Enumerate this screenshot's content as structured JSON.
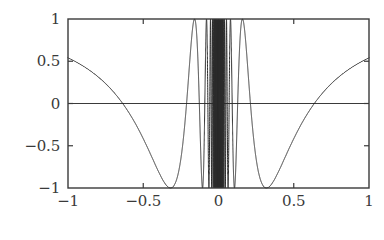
{
  "figure": {
    "background_color": "#ffffff",
    "axes_color": "#3a3a3a",
    "curve_color": "#2b2b2b",
    "zero_line_color": "#3a3a3a"
  },
  "chart_data": {
    "type": "line",
    "title": "",
    "subtitle": "",
    "xlabel": "",
    "ylabel": "",
    "function": "cos(1/x)",
    "xlim": [
      -1,
      1
    ],
    "ylim": [
      -1,
      1
    ],
    "grid": false,
    "legend": null,
    "legend_position": "none",
    "box_frame": true,
    "tick_direction": "in",
    "zero_line": true,
    "xticks": [
      -1,
      -0.5,
      0,
      0.5,
      1
    ],
    "xticklabels": [
      "-1",
      "-0.5",
      "0",
      "0.5",
      "1"
    ],
    "yticks": [
      -1,
      -0.5,
      0,
      0.5,
      1
    ],
    "yticklabels": [
      "-1",
      "-0.5",
      "0",
      "0.5",
      "1"
    ],
    "annotations": [],
    "series": [
      {
        "name": "cos(1/x)",
        "color": "#2b2b2b",
        "linewidth": 1,
        "samples": 20000,
        "x_range": [
          -1,
          1
        ],
        "key_points": [
          {
            "x": -1.0,
            "y": 0.5403
          },
          {
            "x": -0.6366,
            "y": 0.0
          },
          {
            "x": -0.5,
            "y": -0.4161
          },
          {
            "x": -0.3183,
            "y": -1.0
          },
          {
            "x": -0.2122,
            "y": 0.0
          },
          {
            "x": -0.1592,
            "y": 1.0
          },
          {
            "x": -0.1274,
            "y": 0.0
          },
          {
            "x": -0.1061,
            "y": -1.0
          },
          {
            "x": -0.05,
            "y": -0.4081
          },
          {
            "x": 0.0,
            "y": null
          },
          {
            "x": 0.05,
            "y": -0.4081
          },
          {
            "x": 0.1061,
            "y": -1.0
          },
          {
            "x": 0.1274,
            "y": 0.0
          },
          {
            "x": 0.1592,
            "y": 1.0
          },
          {
            "x": 0.2122,
            "y": 0.0
          },
          {
            "x": 0.3183,
            "y": -1.0
          },
          {
            "x": 0.5,
            "y": -0.4161
          },
          {
            "x": 0.6366,
            "y": 0.0
          },
          {
            "x": 1.0,
            "y": 0.5403
          }
        ]
      }
    ]
  }
}
